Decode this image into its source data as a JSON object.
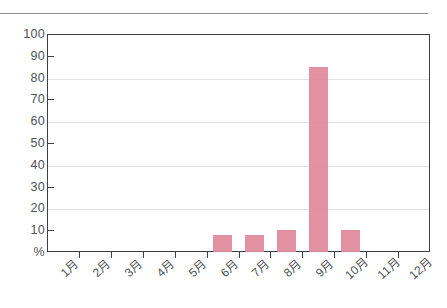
{
  "chart_data": {
    "type": "bar",
    "title": "",
    "subtitle": "",
    "xlabel": "",
    "ylabel": "%",
    "unit_label": "%",
    "categories": [
      "1月",
      "2月",
      "3月",
      "4月",
      "5月",
      "6月",
      "7月",
      "8月",
      "9月",
      "10月",
      "11月",
      "12月"
    ],
    "values": [
      0,
      0,
      0,
      0,
      0,
      8,
      8,
      10,
      85,
      10,
      0,
      0
    ],
    "ylim": [
      0,
      100
    ],
    "ytick_labels": [
      "100",
      "90",
      "80",
      "70",
      "60",
      "50",
      "40",
      "30",
      "20",
      "10",
      "%"
    ],
    "ytick_values": [
      100,
      90,
      80,
      70,
      60,
      50,
      40,
      30,
      20,
      10,
      0
    ],
    "gridline_values": [
      80,
      60,
      40,
      20
    ],
    "axis_tick_values": [
      90,
      70,
      50,
      30,
      10
    ],
    "grid": true,
    "legend": false,
    "legend_position": "none",
    "bar_color": "#e0899b",
    "axis_color": "#3c3f43",
    "grid_color": "#dfe0e2",
    "text_color": "#4f5256"
  }
}
